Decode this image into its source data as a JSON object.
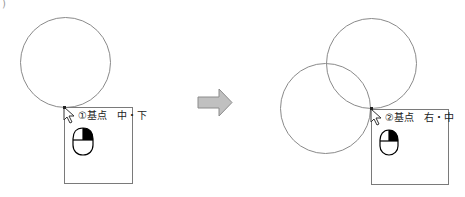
{
  "diagram": {
    "stray_mark": ")",
    "before": {
      "circles": [
        {
          "cx": 65,
          "cy": 62,
          "r": 45
        }
      ],
      "popup": {
        "x": 64,
        "y": 107,
        "width": 69,
        "height": 77,
        "label": "①基点　中・下",
        "mouse_icon": "mouse-right-button-icon"
      }
    },
    "arrow": {
      "icon": "right-arrow-icon",
      "color": "#c0c0c0",
      "border": "#8c8c8c"
    },
    "after": {
      "circles": [
        {
          "cx": 372,
          "cy": 63,
          "r": 45
        },
        {
          "cx": 326,
          "cy": 108,
          "r": 45
        }
      ],
      "popup": {
        "x": 371,
        "y": 109,
        "width": 78,
        "height": 76,
        "label": "②基点　右・中",
        "mouse_icon": "mouse-right-button-icon"
      }
    },
    "colors": {
      "circle_stroke": "#8a8a8a",
      "box_stroke": "#7a7a7a",
      "mouse_fill": "#ffffff",
      "mouse_button_active": "#000000"
    }
  }
}
